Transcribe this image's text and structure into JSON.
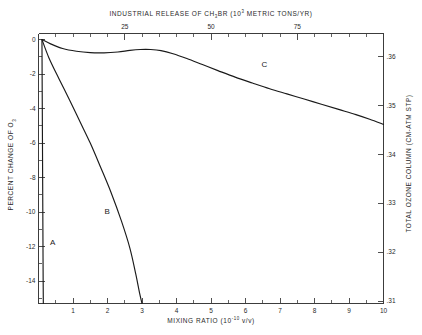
{
  "chart_data": {
    "type": "line",
    "title_parts": {
      "lead": "INDUSTRIAL RELEASE OF CH",
      "sub": "3",
      "mid": "BR (10",
      "sup": "3",
      "tail": " METRIC TONS/YR)"
    },
    "xlabel": "MIXING RATIO (10^-10 v/v)",
    "xlabel_parts": {
      "lead": "MIXING RATIO (10",
      "sup": "-10",
      "tail": " v/v)"
    },
    "ylabel": "PERCENT CHANGE OF O3",
    "ylabel_parts": {
      "lead": "PERCENT CHANGE OF O",
      "sub": "3"
    },
    "y2label": "TOTAL OZONE COLUMN (CM-ATM STP)",
    "xlim": [
      0,
      10
    ],
    "ylim": [
      -15.3,
      0.35
    ],
    "y2lim": [
      0.3095,
      0.3648
    ],
    "x2lim": [
      0,
      100
    ],
    "xticks": [
      1,
      2,
      3,
      4,
      5,
      6,
      7,
      8,
      9,
      10
    ],
    "xtick_labels": [
      "1",
      "2",
      "3",
      "4",
      "5",
      "6",
      "7",
      "8",
      "9",
      "10"
    ],
    "x2ticks_major": [
      25,
      50,
      75
    ],
    "x2tick_labels": [
      "25",
      "50",
      "75"
    ],
    "x2ticks_minor": [
      5,
      10,
      15,
      20,
      30,
      35,
      40,
      45,
      55,
      60,
      65,
      70,
      80,
      85,
      90,
      95,
      100
    ],
    "yticks": [
      0,
      -2,
      -4,
      -6,
      -8,
      -10,
      -12,
      -14
    ],
    "ytick_labels": [
      "0",
      "-2",
      "-4",
      "-6",
      "-8",
      "-10",
      "-12",
      "-14"
    ],
    "yticks_minor": [
      -1,
      -3,
      -5,
      -7,
      -9,
      -11,
      -13,
      -15
    ],
    "y2ticks": [
      0.36,
      0.35,
      0.34,
      0.33,
      0.32,
      0.31
    ],
    "y2tick_labels": [
      ".36",
      ".35",
      ".34",
      ".33",
      ".32",
      ".31"
    ],
    "grid": false,
    "legend_position": "inline-curve-labels",
    "series": [
      {
        "name": "A",
        "label": "A",
        "label_x": 0.42,
        "label_y": -11.8,
        "points": [
          [
            0.1,
            0.0
          ],
          [
            0.105,
            -2.0
          ],
          [
            0.11,
            -4.0
          ],
          [
            0.115,
            -6.0
          ],
          [
            0.12,
            -8.0
          ],
          [
            0.125,
            -10.0
          ],
          [
            0.13,
            -12.0
          ],
          [
            0.135,
            -14.0
          ],
          [
            0.14,
            -15.3
          ]
        ]
      },
      {
        "name": "B",
        "label": "B",
        "label_x": 2.0,
        "label_y": -10.0,
        "points": [
          [
            0.1,
            0.0
          ],
          [
            0.3,
            -1.05
          ],
          [
            0.6,
            -2.3
          ],
          [
            0.9,
            -3.5
          ],
          [
            1.2,
            -4.75
          ],
          [
            1.5,
            -6.0
          ],
          [
            1.8,
            -7.4
          ],
          [
            2.1,
            -8.85
          ],
          [
            2.4,
            -10.5
          ],
          [
            2.65,
            -12.1
          ],
          [
            2.82,
            -13.6
          ],
          [
            2.93,
            -14.7
          ],
          [
            3.0,
            -15.3
          ]
        ]
      },
      {
        "name": "C",
        "label": "C",
        "label_x": 6.55,
        "label_y": -1.45,
        "points": [
          [
            0.1,
            0.0
          ],
          [
            0.35,
            -0.25
          ],
          [
            0.7,
            -0.52
          ],
          [
            1.1,
            -0.68
          ],
          [
            1.5,
            -0.76
          ],
          [
            1.9,
            -0.77
          ],
          [
            2.3,
            -0.72
          ],
          [
            2.65,
            -0.63
          ],
          [
            2.95,
            -0.58
          ],
          [
            3.25,
            -0.58
          ],
          [
            3.55,
            -0.64
          ],
          [
            3.9,
            -0.82
          ],
          [
            4.3,
            -1.1
          ],
          [
            4.75,
            -1.45
          ],
          [
            5.2,
            -1.8
          ],
          [
            5.7,
            -2.18
          ],
          [
            6.2,
            -2.52
          ],
          [
            6.7,
            -2.85
          ],
          [
            7.2,
            -3.15
          ],
          [
            7.7,
            -3.45
          ],
          [
            8.2,
            -3.75
          ],
          [
            8.7,
            -4.05
          ],
          [
            9.2,
            -4.35
          ],
          [
            9.6,
            -4.62
          ],
          [
            10.0,
            -4.92
          ]
        ]
      }
    ]
  },
  "colors": {
    "axis": "#3c3c3c",
    "curve": "#1a1a1a",
    "text": "#2a2a2a",
    "background": "#ffffff"
  }
}
